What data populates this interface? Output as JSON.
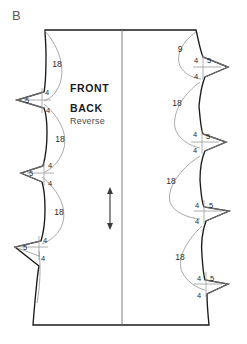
{
  "figure": {
    "plate_label": "B",
    "caption_strong_1": "FRONT",
    "caption_strong_2": "BACK",
    "caption_light": "Reverse",
    "background_color": "#ffffff",
    "outline_color": "#1a1a1a",
    "guide_color": "#9a9a9a",
    "fold_color": "#6e6e6e",
    "grain_color": "#3a3a3a"
  },
  "grainline": {
    "name": "grainline-arrow",
    "orientation": "vertical",
    "double_headed": true,
    "x": 110,
    "y_top": 188,
    "y_bottom": 229
  },
  "foldline": {
    "name": "center-fold-line",
    "x": 122,
    "y_top": 30,
    "y_bottom": 325
  },
  "panel": {
    "top_y": 30,
    "bottom_y": 325,
    "top_left_x": 45,
    "top_right_x": 196,
    "bottom_left_x": 33,
    "bottom_right_x": 209
  },
  "left_notches": [
    {
      "id": "left-notch-1",
      "cy": 100,
      "tip_x": 17,
      "label_center": "5",
      "label_upper": "4",
      "label_lower": "4"
    },
    {
      "id": "left-notch-2",
      "cy": 173,
      "tip_x": 21,
      "label_center": "5",
      "label_upper": "4",
      "label_lower": "4"
    },
    {
      "id": "left-notch-3",
      "cy": 247,
      "tip_x": 15,
      "label_center": "5",
      "label_upper": "4",
      "label_lower": "4"
    }
  ],
  "right_notches": [
    {
      "id": "right-notch-1",
      "cy": 67,
      "tip_x": 228,
      "label_center": "5",
      "label_upper": "4",
      "label_lower": "4"
    },
    {
      "id": "right-notch-2",
      "cy": 142,
      "tip_x": 226,
      "label_center": "5",
      "label_upper": "4",
      "label_lower": "4"
    },
    {
      "id": "right-notch-3",
      "cy": 211,
      "tip_x": 229,
      "label_center": "5",
      "label_upper": "4",
      "label_lower": "4"
    },
    {
      "id": "right-notch-4",
      "cy": 284,
      "tip_x": 228,
      "label_center": "5",
      "label_upper": "4",
      "label_lower": "4"
    }
  ],
  "left_arc_labels": [
    {
      "id": "left-arc-label-1",
      "value": "18",
      "x": 57,
      "y": 64
    },
    {
      "id": "left-arc-label-2",
      "value": "18",
      "x": 60,
      "y": 139
    },
    {
      "id": "left-arc-label-3",
      "value": "18",
      "x": 59,
      "y": 212
    }
  ],
  "right_arc_labels": [
    {
      "id": "right-arc-label-0",
      "value": "9",
      "x": 180,
      "y": 49
    },
    {
      "id": "right-arc-label-1",
      "value": "18",
      "x": 177,
      "y": 103
    },
    {
      "id": "right-arc-label-2",
      "value": "18",
      "x": 171,
      "y": 181
    },
    {
      "id": "right-arc-label-3",
      "value": "18",
      "x": 180,
      "y": 257
    }
  ]
}
